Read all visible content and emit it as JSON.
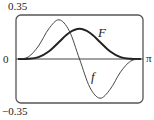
{
  "chart_data": {
    "type": "line",
    "title": "",
    "xlabel": "",
    "ylabel": "",
    "xlim": [
      0,
      3.14159
    ],
    "ylim": [
      -0.35,
      0.35
    ],
    "grid": false,
    "legend": "none (inline curve labels)",
    "y_tick_labels": [
      "0.35",
      "0",
      "-0.35"
    ],
    "x_tick_labels": [
      "π"
    ],
    "x": [
      0,
      0.2618,
      0.5236,
      0.7854,
      1.0472,
      1.309,
      1.5708,
      1.8326,
      2.0944,
      2.3562,
      2.618,
      2.8798,
      3.1416
    ],
    "series": [
      {
        "name": "F",
        "label": "F",
        "stroke_width": 2,
        "values": [
          0,
          0.0011,
          0.015,
          0.06,
          0.135,
          0.2089,
          0.24,
          0.2089,
          0.135,
          0.06,
          0.015,
          0.0011,
          0
        ]
      },
      {
        "name": "f",
        "label": "f",
        "stroke_width": 1,
        "values": [
          0,
          0.0161,
          0.1039,
          0.24,
          0.3118,
          0.2239,
          0,
          -0.2239,
          -0.3118,
          -0.24,
          -0.1039,
          -0.0161,
          0
        ]
      }
    ],
    "annotations": [
      {
        "text": "F",
        "near_x": 1.95,
        "near_y": 0.2
      },
      {
        "text": "f",
        "near_x": 1.95,
        "near_y": -0.15
      }
    ]
  },
  "labels": {
    "y_top": "0.35",
    "y_zero": "0",
    "y_bottom": "−0.35",
    "x_end": "π",
    "curve_F": "F",
    "curve_f": "f"
  },
  "colors": {
    "frame": "#555555",
    "axis": "#444444",
    "curve": "#222222"
  }
}
